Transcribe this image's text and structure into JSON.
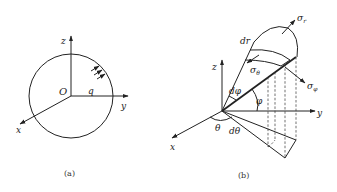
{
  "figure_a": {
    "caption": "(a)",
    "labels": {
      "z": "z",
      "y": "y",
      "x": "x",
      "origin": "O",
      "load": "q"
    }
  },
  "figure_b": {
    "caption": "(b)",
    "labels": {
      "z": "z",
      "y": "y",
      "x": "x",
      "dr": "dr",
      "sigma_r": "σ",
      "sigma_r_sub": "r",
      "sigma_theta": "σ",
      "sigma_theta_sub": "θ",
      "sigma_phi": "σ",
      "sigma_phi_sub": "φ",
      "dphi": "dφ",
      "phi": "φ",
      "theta": "θ",
      "dtheta": "dθ"
    }
  },
  "colors": {
    "ink": "#222222",
    "background": "#ffffff"
  }
}
